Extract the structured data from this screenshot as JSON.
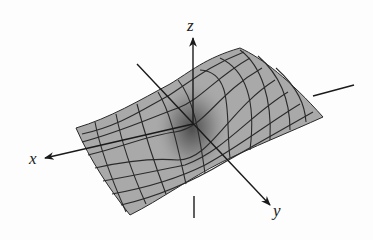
{
  "figure": {
    "type": "3d-surface-mesh",
    "colors": {
      "surface_fill": "#a9a9a9",
      "surface_dark": "#5a5a5a",
      "mesh_lines": "#2a2a2a",
      "axes": "#1a1a1a",
      "background": "#fdfdfd"
    },
    "axes": {
      "x": {
        "label": "x"
      },
      "y": {
        "label": "y"
      },
      "z": {
        "label": "z"
      }
    }
  }
}
